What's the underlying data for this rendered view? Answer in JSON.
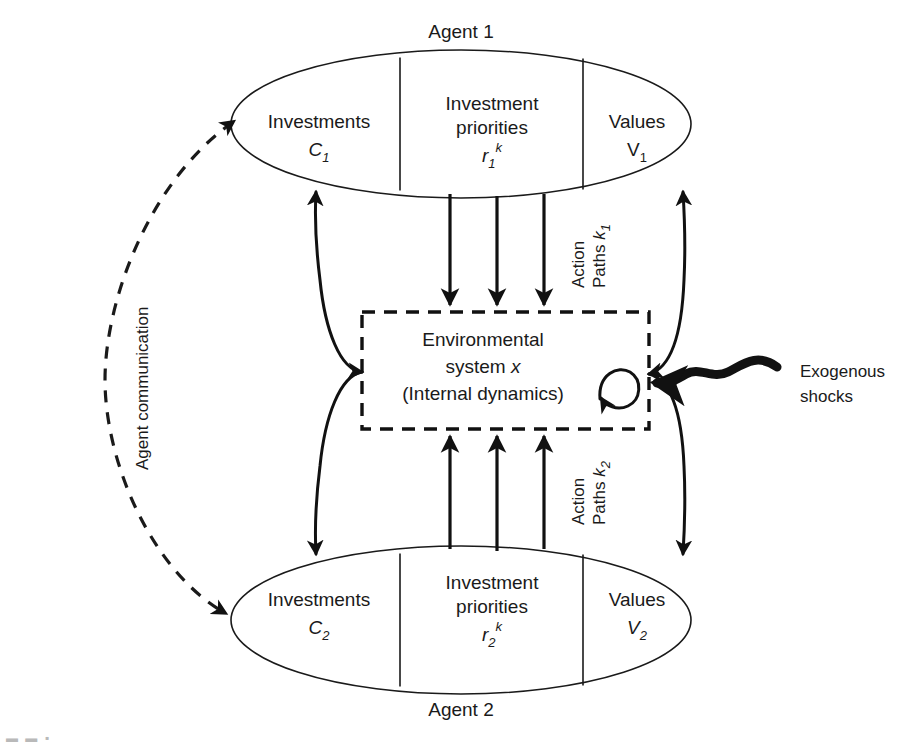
{
  "figure": {
    "kind": "conceptual-diagram",
    "background": "#ffffff",
    "ink_color": "#111111"
  },
  "agent_top": {
    "title": "Agent 1",
    "cells": [
      {
        "label": "Investments",
        "symbol_base": "C",
        "symbol_sub": "1",
        "symbol_sup": ""
      },
      {
        "label_line1": "Investment",
        "label_line2": "priorities",
        "symbol_base": "r",
        "symbol_sub": "1",
        "symbol_sup": "k"
      },
      {
        "label": "Values",
        "symbol_base": "V",
        "symbol_sub": "1",
        "symbol_sup": ""
      }
    ]
  },
  "agent_bottom": {
    "title": "Agent 2",
    "cells": [
      {
        "label": "Investments",
        "symbol_base": "C",
        "symbol_sub": "2",
        "symbol_sup": ""
      },
      {
        "label_line1": "Investment",
        "label_line2": "priorities",
        "symbol_base": "r",
        "symbol_sub": "2",
        "symbol_sup": "k"
      },
      {
        "label": "Values",
        "symbol_base": "V",
        "symbol_sub": "2",
        "symbol_sup": ""
      }
    ]
  },
  "environment": {
    "line1": "Environmental",
    "line2_prefix": "system ",
    "line2_symbol": "x",
    "line3": "(Internal dynamics)",
    "self_loop_icon": "internal-dynamics-loop-icon"
  },
  "annotations": {
    "action_paths_top_prefix": "Action",
    "action_paths_top_line2": "Paths ",
    "action_paths_top_symbol": "k",
    "action_paths_top_sub": "1",
    "action_paths_bottom_prefix": "Action",
    "action_paths_bottom_line2": "Paths ",
    "action_paths_bottom_symbol": "k",
    "action_paths_bottom_sub": "2",
    "agent_communication": "Agent communication",
    "exogenous_line1": "Exogenous",
    "exogenous_line2": "shocks"
  },
  "caption": {
    "fragment": "▬ ▬ ▪"
  }
}
